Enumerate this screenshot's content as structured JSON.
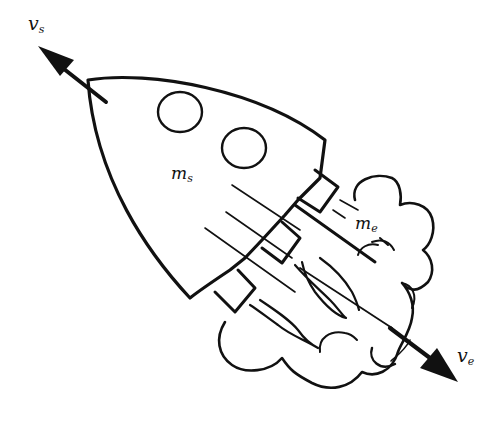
{
  "figure": {
    "ink_color": "#111111",
    "background": "#ffffff"
  },
  "labels": {
    "ship_velocity": {
      "base": "v",
      "sub": "s"
    },
    "ship_mass": {
      "base": "m",
      "sub": "s"
    },
    "exhaust_mass": {
      "base": "m",
      "sub": "e"
    },
    "exhaust_velocity": {
      "base": "v",
      "sub": "e"
    }
  },
  "elements": {
    "rocket_body": "rocket hull with two portholes",
    "nozzles": 3,
    "portholes": 2,
    "exhaust_cloud": "exhaust plume cloud",
    "arrows": [
      "ship velocity arrow (up-left)",
      "exhaust velocity arrow (down-right)"
    ]
  }
}
